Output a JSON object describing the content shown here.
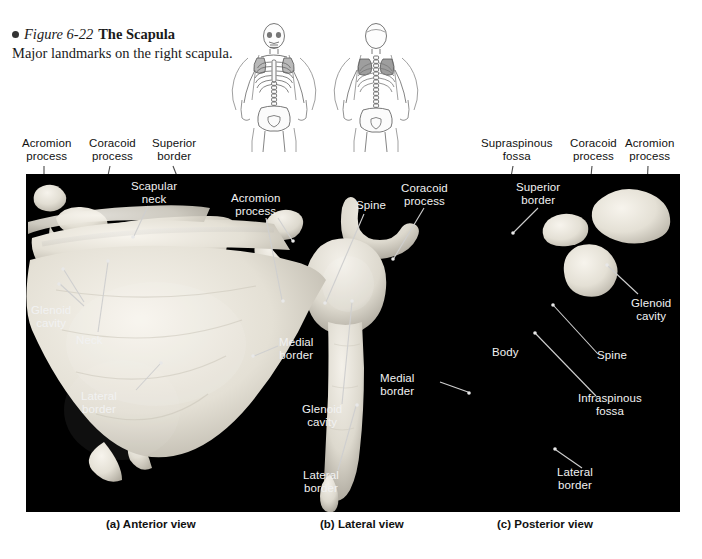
{
  "figure": {
    "bullet": "●",
    "number": "Figure 6-22",
    "title": "The Scapula",
    "subtitle": "Major landmarks on the right scapula."
  },
  "orientation_figures": [
    {
      "name": "skeleton-anterior-view",
      "alt": "anterior human skeleton with scapula highlighted"
    },
    {
      "name": "skeleton-posterior-view",
      "alt": "posterior human skeleton with scapula highlighted"
    }
  ],
  "labels": {
    "anterior": {
      "acromion_process": "Acromion\nprocess",
      "coracoid_process": "Coracoid\nprocess",
      "superior_border": "Superior\nborder",
      "scapular_neck": "Scapular\nneck",
      "glenoid_cavity": "Glenoid\ncavity",
      "neck": "Neck",
      "lateral_border": "Lateral\nborder",
      "medial_border": "Medial\nborder"
    },
    "lateral": {
      "acromion_process": "Acromion\nprocess",
      "spine": "Spine",
      "coracoid_process": "Coracoid\nprocess",
      "glenoid_cavity": "Glenoid\ncavity",
      "medial_border": "Medial\nborder",
      "lateral_border": "Lateral\nborder"
    },
    "posterior": {
      "supraspinous_fossa": "Supraspinous\nfossa",
      "coracoid_process": "Coracoid\nprocess",
      "acromion_process": "Acromion\nprocess",
      "superior_border": "Superior\nborder",
      "glenoid_cavity": "Glenoid\ncavity",
      "body": "Body",
      "spine": "Spine",
      "infraspinous_fossa": "Infraspinous\nfossa",
      "lateral_border": "Lateral\nborder"
    }
  },
  "captions": {
    "a": "(a) Anterior view",
    "b": "(b) Lateral view",
    "c": "(c) Posterior view"
  },
  "colors": {
    "page_background": "#ffffff",
    "panel_background": "#000000",
    "label_dark": "#111111",
    "label_light": "#f2f2f2",
    "leader_dark": "#4a4a4a",
    "leader_light": "#cfcfcf",
    "bone_highlight": "#f0ece4"
  }
}
